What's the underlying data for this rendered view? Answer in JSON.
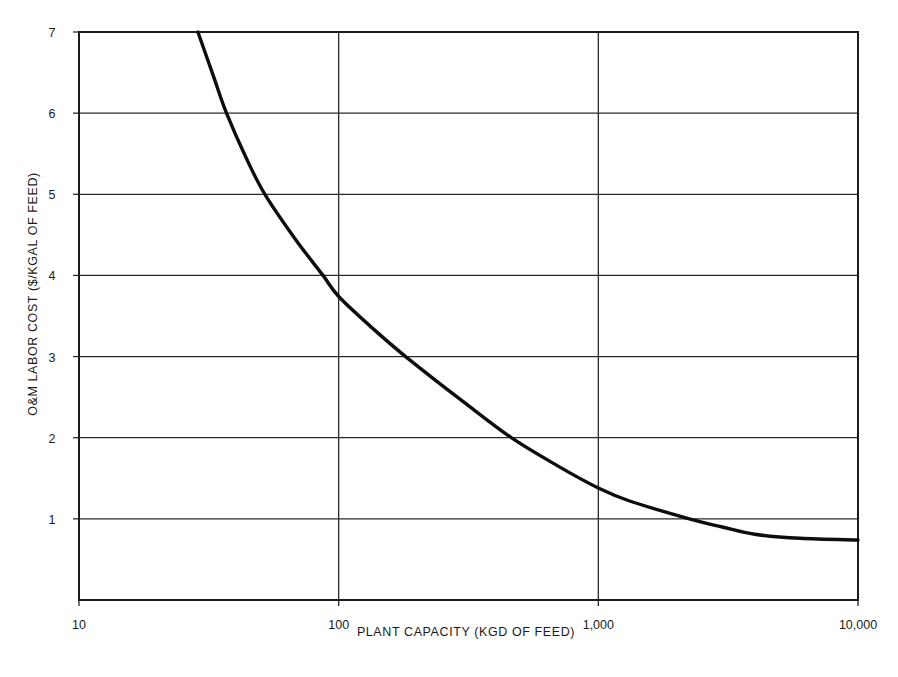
{
  "chart_data": {
    "type": "line",
    "title": "",
    "xlabel": "PLANT CAPACITY (KGD OF FEED)",
    "ylabel": "O&M LABOR COST ($/KGAL  OF FEED)",
    "xscale": "log",
    "xlim": [
      10,
      10000
    ],
    "ylim": [
      0,
      7
    ],
    "grid": true,
    "legend": null,
    "x_ticks": [
      10,
      100,
      1000,
      10000
    ],
    "x_tick_labels": [
      "10",
      "100",
      "1,000",
      "10,000"
    ],
    "y_ticks": [
      1,
      2,
      3,
      4,
      5,
      6,
      7
    ],
    "y_tick_labels": [
      "1",
      "2",
      "3",
      "4",
      "5",
      "6",
      "7"
    ],
    "series": [
      {
        "name": "O&M labor cost",
        "color": "#0d0d0d",
        "x": [
          28.7,
          33,
          37,
          44,
          52,
          68,
          87,
          100,
          135,
          181,
          300,
          462,
          700,
          1000,
          1320,
          2240,
          3000,
          4000,
          6000,
          10000
        ],
        "y": [
          7.0,
          6.45,
          6.0,
          5.45,
          5.0,
          4.45,
          4.0,
          3.74,
          3.35,
          3.0,
          2.45,
          2.0,
          1.65,
          1.38,
          1.22,
          1.0,
          0.9,
          0.81,
          0.76,
          0.74
        ]
      }
    ]
  }
}
